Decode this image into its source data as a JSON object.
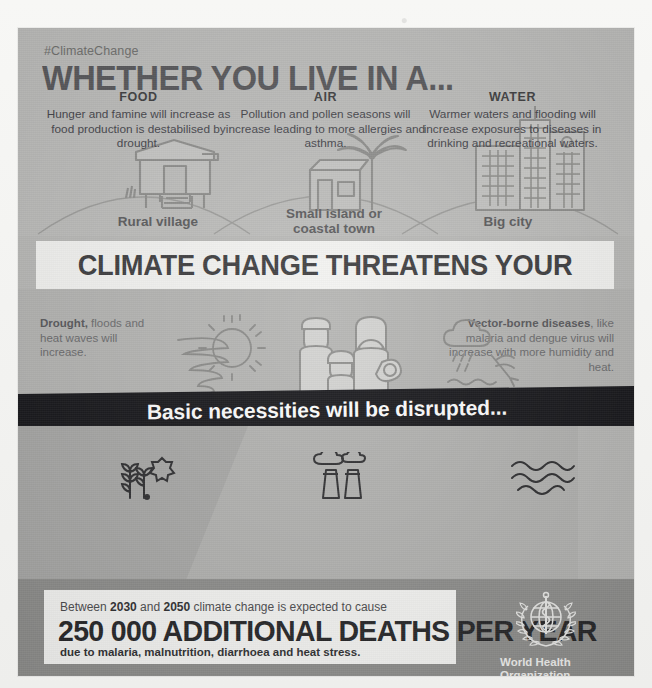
{
  "poster": {
    "hashtag": "#ClimateChange",
    "headline": "WHETHER YOU LIVE IN A...",
    "locations": [
      {
        "label": "Rural village",
        "icon": "stilt-house-icon"
      },
      {
        "label": "Small island or\ncoastal town",
        "icon": "house-palm-tree-icon"
      },
      {
        "label": "Big city",
        "icon": "skyscrapers-icon"
      }
    ],
    "main_banner": "CLIMATE CHANGE THREATENS YOUR HEALTH",
    "mid": {
      "left": {
        "bold": "Drought,",
        "rest": "floods and heat waves will increase.",
        "icon": "sun-tornado-icon"
      },
      "center_icon": "family-icon",
      "right": {
        "bold": "Vector-borne diseases",
        "rest": ", like malaria and dengue virus will increase with more humidity and heat.",
        "icon": "rain-cloud-mosquito-icon"
      }
    },
    "dark_banner": "Basic necessities will be disrupted...",
    "columns": [
      {
        "title": "FOOD",
        "icon": "wheat-sun-icon",
        "text": "Hunger and famine will increase as food production is destabilised by drought."
      },
      {
        "title": "AIR",
        "icon": "factory-smoke-icon",
        "text": "Pollution and pollen seasons will increase leading to more allergies and asthma."
      },
      {
        "title": "WATER",
        "icon": "waves-icon",
        "text": "Warmer waters and flooding will increase exposures to diseases in drinking and recreational waters."
      }
    ],
    "footer": {
      "lead_pre": "Between ",
      "lead_year1": "2030",
      "lead_mid": " and ",
      "lead_year2": "2050",
      "lead_post": " climate change is expected to cause",
      "headline": "250 000 ADDITIONAL DEATHS PER YEAR",
      "sub": "due to malaria, malnutrition, diarrhoea and heat stress.",
      "org_name": "World Health\nOrganization",
      "org_logo": "who-emblem-icon"
    },
    "colors": {
      "panel": "#b9b9b7",
      "dark_band": "#16161a",
      "white_band": "#f4f4f2",
      "ink": "#57575a",
      "footer_bg": "#8d8d8b"
    }
  }
}
